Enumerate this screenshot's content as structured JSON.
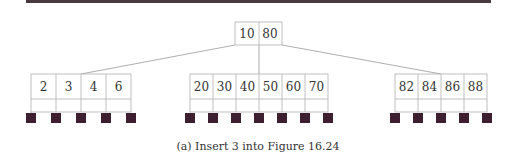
{
  "figure": {
    "caption": "(a) Insert 3 into Figure 16.24",
    "root": {
      "keys": [
        "10",
        "80"
      ]
    },
    "leaves": [
      {
        "keys": [
          "2",
          "3",
          "4",
          "6"
        ],
        "children": 5
      },
      {
        "keys": [
          "20",
          "30",
          "40",
          "50",
          "60",
          "70"
        ],
        "children": 7
      },
      {
        "keys": [
          "82",
          "84",
          "86",
          "88"
        ],
        "children": 5
      }
    ],
    "colors": {
      "node_border": "#b0b0b0",
      "edge": "#888888",
      "leaf_block": "#3d1f30",
      "text": "#333333",
      "top_rule": "#4a3a40"
    }
  }
}
